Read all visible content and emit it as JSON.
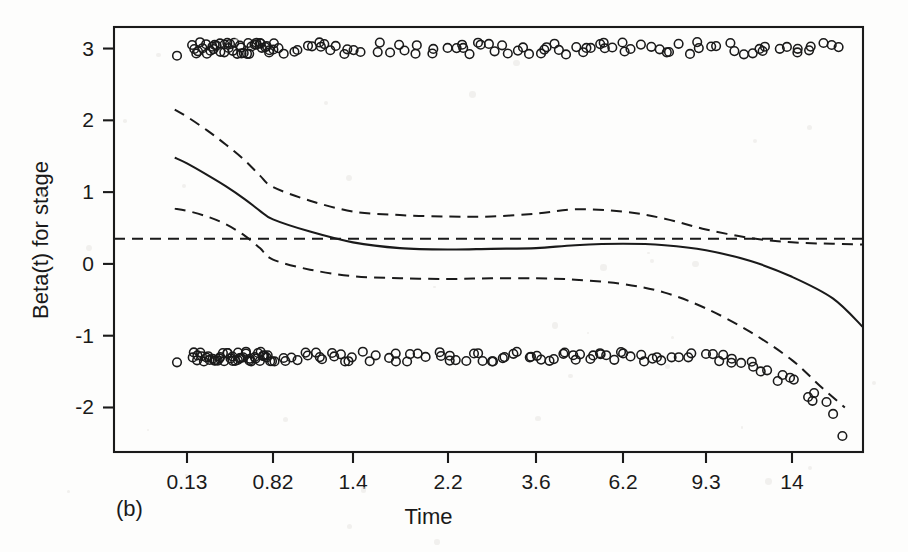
{
  "figure": {
    "panel_label": "(b)",
    "background_color": "#fdfdfc",
    "ink_color": "#1a1a1a"
  },
  "chart_data": {
    "type": "line",
    "title": "",
    "subtitle": "",
    "xlabel": "Time",
    "ylabel": "Beta(t) for stage",
    "xscale": "log-spaced event times",
    "x_tick_labels": [
      "0.13",
      "0.82",
      "1.4",
      "2.2",
      "3.6",
      "6.2",
      "9.3",
      "14"
    ],
    "x_tick_values": [
      0.13,
      0.82,
      1.4,
      2.2,
      3.6,
      6.2,
      9.3,
      14
    ],
    "x_tick_pixels": [
      187,
      273,
      353,
      448,
      536,
      623,
      706,
      792
    ],
    "y_tick_labels": [
      "3",
      "2",
      "1",
      "0",
      "-1",
      "-2"
    ],
    "y_tick_values": [
      3,
      2,
      1,
      0,
      -1,
      -2
    ],
    "ylim": [
      -2.62,
      3.3
    ],
    "grid": false,
    "legend": null,
    "plot_box": {
      "left": 114,
      "right": 863,
      "top": 27,
      "bottom": 452
    },
    "series": [
      {
        "name": "Beta(t) estimate",
        "style": "solid",
        "color": "#1a1a1a",
        "x": [
          0.1,
          0.13,
          0.2,
          0.3,
          0.45,
          0.62,
          0.82,
          1.05,
          1.4,
          1.75,
          2.2,
          2.8,
          3.6,
          4.6,
          6.2,
          7.6,
          9.3,
          11.5,
          14.0,
          17.0,
          20.0
        ],
        "y": [
          1.48,
          1.4,
          1.24,
          1.08,
          0.9,
          0.74,
          0.62,
          0.45,
          0.3,
          0.22,
          0.2,
          0.21,
          0.22,
          0.26,
          0.28,
          0.26,
          0.19,
          0.04,
          -0.18,
          -0.48,
          -0.88
        ]
      },
      {
        "name": "Upper 95% confidence band",
        "style": "dashed",
        "color": "#1a1a1a",
        "x": [
          0.1,
          0.13,
          0.2,
          0.3,
          0.45,
          0.62,
          0.82,
          1.05,
          1.4,
          1.75,
          2.2,
          2.8,
          3.6,
          4.6,
          6.2,
          7.6,
          9.3,
          11.5,
          14.0,
          17.0,
          20.0
        ],
        "y": [
          2.15,
          2.05,
          1.86,
          1.66,
          1.44,
          1.23,
          1.07,
          0.88,
          0.73,
          0.68,
          0.66,
          0.66,
          0.7,
          0.76,
          0.73,
          0.63,
          0.48,
          0.36,
          0.3,
          0.28,
          0.27
        ]
      },
      {
        "name": "Lower 95% confidence band",
        "style": "dashed",
        "color": "#1a1a1a",
        "x": [
          0.1,
          0.13,
          0.2,
          0.3,
          0.45,
          0.62,
          0.82,
          1.05,
          1.4,
          1.75,
          2.2,
          2.8,
          3.6,
          4.6,
          6.2,
          7.6,
          9.3,
          11.5,
          14.0,
          16.0,
          18.0
        ],
        "y": [
          0.77,
          0.74,
          0.66,
          0.55,
          0.39,
          0.22,
          0.06,
          -0.08,
          -0.17,
          -0.2,
          -0.21,
          -0.2,
          -0.2,
          -0.22,
          -0.28,
          -0.4,
          -0.62,
          -0.95,
          -1.34,
          -1.7,
          -2.0
        ]
      },
      {
        "name": "Null reference line",
        "style": "dashed-horizontal",
        "color": "#1a1a1a",
        "y_constant": 0.35
      }
    ],
    "scatter_rows": [
      {
        "name": "events with stage = upper level",
        "marker": "open-circle",
        "y_center": 3.0,
        "y_jitter": 0.09,
        "n_points": 126
      },
      {
        "name": "events with stage = lower level",
        "marker": "open-circle",
        "y_center": -1.29,
        "y_jitter": 0.07,
        "n_points": 138
      }
    ]
  }
}
